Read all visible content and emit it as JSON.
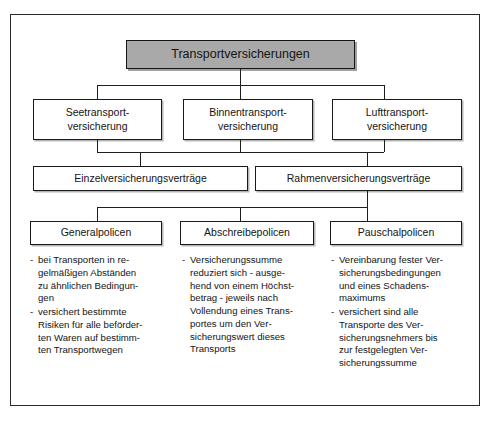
{
  "diagram": {
    "title_box": {
      "label": "Transportversicherungen"
    },
    "level2": [
      {
        "line1": "Seetransport-",
        "line2": "versicherung"
      },
      {
        "line1": "Binnentransport-",
        "line2": "versicherung"
      },
      {
        "line1": "Lufttransport-",
        "line2": "versicherung"
      }
    ],
    "level3": [
      {
        "label": "Einzelversicherungsverträge"
      },
      {
        "label": "Rahmenversicherungsverträge"
      }
    ],
    "level4": [
      {
        "label": "Generalpolicen"
      },
      {
        "label": "Abschreibepolicen"
      },
      {
        "label": "Pauschalpolicen"
      }
    ],
    "details": [
      {
        "dash": "-",
        "items": [
          "bei Transporten in re-\ngelmäßigen Abständen\nzu ähnlichen Bedingun-\ngen",
          "versichert bestimmte\nRisiken für alle beförder-\nten Waren auf bestimm-\nten Transportwegen"
        ]
      },
      {
        "dash": "-",
        "items": [
          "Versicherungssumme\nreduziert sich - ausge-\nhend von einem Höchst-\nbetrag - jeweils nach\nVollendung eines Trans-\nportes um den Ver-\nsicherungswert dieses\nTransports"
        ]
      },
      {
        "dash": "-",
        "items": [
          "Vereinbarung fester Ver-\nsicherungsbedingungen\nund eines Schadens-\nmaximums",
          "versichert sind alle\nTransporte des Ver-\nsicherungsnehmers bis\nzur festgelegten Ver-\nsicherungssumme"
        ]
      }
    ],
    "colors": {
      "title_fill": "#a9a9a9",
      "border": "#1a1a1a",
      "background": "#ffffff",
      "text": "#141414"
    }
  }
}
